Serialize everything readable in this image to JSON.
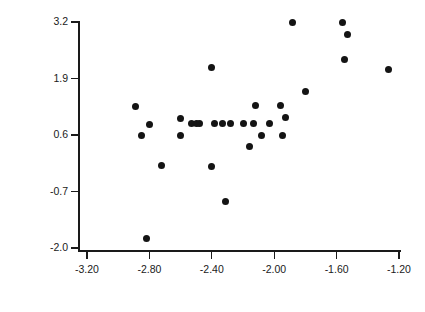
{
  "chart_data": {
    "type": "scatter",
    "title": "",
    "subtitle": "",
    "xlabel": "",
    "ylabel": "Output per establishment (m/e)   (natural log units)",
    "xlim": [
      -3.2,
      -1.2
    ],
    "ylim": [
      -2.0,
      3.2
    ],
    "xticks": [
      -3.2,
      -2.8,
      -2.4,
      -2.0,
      -1.6,
      -1.2
    ],
    "xticklabels": [
      "-3.20",
      "-2.80",
      "-2.40",
      "-2.00",
      "-1.60",
      "-1.20"
    ],
    "yticks": [
      3.2,
      1.9,
      0.6,
      -0.7,
      -2.0
    ],
    "yticklabels": [
      "3.2",
      "1.9",
      "0.6",
      "-0.7",
      "-2.0"
    ],
    "grid": false,
    "legend": null,
    "marker": "filled-circle",
    "marker_color": "#141414",
    "axis_color": "#1a1a1a",
    "background_color": "#ffffff",
    "n_points": 31,
    "points": [
      {
        "x": -2.89,
        "y": 1.26
      },
      {
        "x": -2.85,
        "y": 0.6
      },
      {
        "x": -2.8,
        "y": 0.85
      },
      {
        "x": -2.72,
        "y": -0.11
      },
      {
        "x": -2.6,
        "y": 0.99
      },
      {
        "x": -2.6,
        "y": 0.58
      },
      {
        "x": -2.53,
        "y": 0.86
      },
      {
        "x": -2.5,
        "y": 0.86
      },
      {
        "x": -2.4,
        "y": 2.16
      },
      {
        "x": -2.4,
        "y": -0.12
      },
      {
        "x": -2.38,
        "y": 0.86
      },
      {
        "x": -2.33,
        "y": 0.86
      },
      {
        "x": -2.31,
        "y": -0.94
      },
      {
        "x": -2.2,
        "y": 0.86
      },
      {
        "x": -2.16,
        "y": 0.33
      },
      {
        "x": -2.13,
        "y": 0.86
      },
      {
        "x": -2.12,
        "y": 1.28
      },
      {
        "x": -2.08,
        "y": 0.6
      },
      {
        "x": -1.96,
        "y": 1.28
      },
      {
        "x": -1.95,
        "y": 0.59
      },
      {
        "x": -1.93,
        "y": 1.0
      },
      {
        "x": -1.88,
        "y": 3.18
      },
      {
        "x": -1.8,
        "y": 1.59
      },
      {
        "x": -1.56,
        "y": 3.18
      },
      {
        "x": -1.53,
        "y": 2.92
      },
      {
        "x": -1.55,
        "y": 2.33
      },
      {
        "x": -1.27,
        "y": 2.1
      },
      {
        "x": -2.82,
        "y": -1.78
      },
      {
        "x": -2.03,
        "y": 0.86
      },
      {
        "x": -2.28,
        "y": 0.86
      },
      {
        "x": -2.48,
        "y": 0.86
      }
    ]
  },
  "axes": {
    "y_axis_title": "Output per establishment (m/e)   (natural log units)",
    "x_axis_title": ""
  }
}
